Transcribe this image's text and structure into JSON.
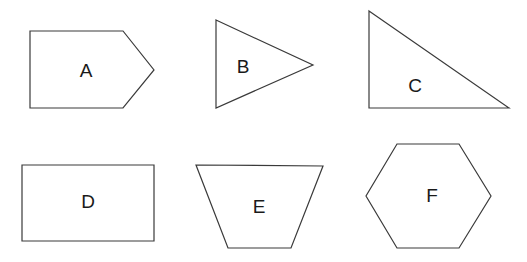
{
  "diagram": {
    "title": "",
    "shapes": [
      {
        "id": "A",
        "label": "A",
        "type": "pentagon-arrow",
        "points": "30,31 123,31 154,70 123,108 30,108",
        "label_pos": [
          86,
          70
        ]
      },
      {
        "id": "B",
        "label": "B",
        "type": "triangle",
        "points": "216,20 313,65 216,108",
        "label_pos": [
          243,
          66
        ]
      },
      {
        "id": "C",
        "label": "C",
        "type": "right-triangle",
        "points": "369,11 509,108 369,108",
        "label_pos": [
          415,
          85
        ]
      },
      {
        "id": "D",
        "label": "D",
        "type": "rectangle",
        "points": "22,165 154,165 154,241 22,241",
        "label_pos": [
          88,
          201
        ]
      },
      {
        "id": "E",
        "label": "E",
        "type": "trapezoid",
        "points": "196,165 323,166 291,248 228,248",
        "label_pos": [
          259,
          206
        ]
      },
      {
        "id": "F",
        "label": "F",
        "type": "hexagon",
        "points": "397,144 459,144 491,196 459,248 397,248 366,196",
        "label_pos": [
          432,
          195
        ]
      }
    ],
    "colors": {
      "stroke": "#3a3a3a",
      "fill": "#ffffff",
      "text": "#1a1a1a"
    }
  }
}
